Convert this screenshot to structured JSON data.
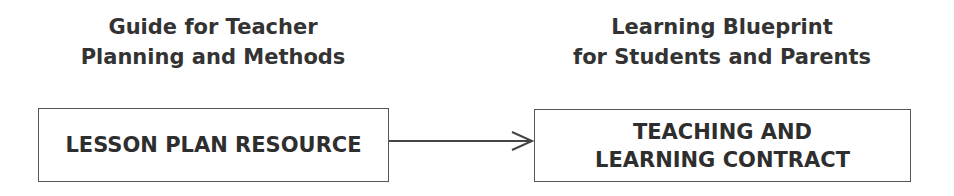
{
  "left": {
    "caption_line1": "Guide for Teacher",
    "caption_line2": "Planning and Methods",
    "box_label": "LESSON PLAN RESOURCE"
  },
  "right": {
    "caption_line1": "Learning Blueprint",
    "caption_line2": "for Students and Parents",
    "box_line1": "TEACHING AND",
    "box_line2": "LEARNING CONTRACT"
  },
  "connector": {
    "type": "arrow",
    "direction": "left-to-right"
  }
}
